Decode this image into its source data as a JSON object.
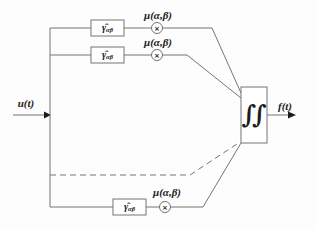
{
  "diagram": {
    "input_label": "u(t)",
    "output_label": "f(t)",
    "integrator_symbol": "∫∫",
    "multiplier_symbol": "×",
    "branches": [
      {
        "gain_symbol": "γ̂",
        "gain_subscript": "αβ",
        "weight_label": "μ(α,β)"
      },
      {
        "gain_symbol": "γ̂",
        "gain_subscript": "αβ",
        "weight_label": "μ(α,β)"
      },
      {
        "gain_symbol": "γ̂",
        "gain_subscript": "αβ",
        "weight_label": "μ(α,β)"
      }
    ],
    "colors": {
      "line": "#757575",
      "text": "#1c1c1c",
      "background": "#fdfdfd"
    }
  }
}
